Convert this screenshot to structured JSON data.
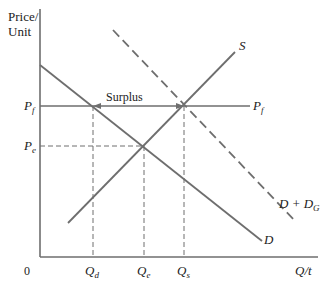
{
  "axes": {
    "y_label_line1": "Price/",
    "y_label_line2": "Unit",
    "x_label": "Q/t",
    "origin": "0"
  },
  "price_labels": {
    "pf": "P",
    "pf_sub": "f",
    "pe": "P",
    "pe_sub": "e",
    "pf_right": "P",
    "pf_right_sub": "f"
  },
  "quantity_labels": {
    "qd": "Q",
    "qd_sub": "d",
    "qe": "Q",
    "qe_sub": "e",
    "qs": "Q",
    "qs_sub": "s"
  },
  "curves": {
    "supply": "S",
    "demand": "D",
    "demand_gov": "D + D",
    "demand_gov_sub": "G"
  },
  "annotation": {
    "surplus": "Surplus"
  },
  "colors": {
    "line": "#6e6e6e",
    "text": "#222222"
  }
}
